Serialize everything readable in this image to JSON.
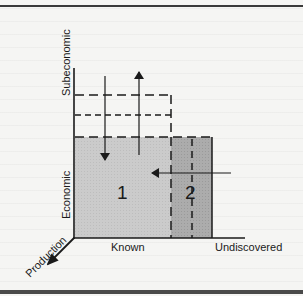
{
  "diagram": {
    "axes": {
      "vertical_upper_label": "Subeconomic",
      "vertical_lower_label": "Economic",
      "horizontal_left_label": "Known",
      "horizontal_right_label": "Undiscovered",
      "depth_label": "Production"
    },
    "regions": [
      {
        "id": "1",
        "label": "1",
        "description": "Known economic resources",
        "fill": "#c8c8c8"
      },
      {
        "id": "2",
        "label": "2",
        "description": "Undiscovered economic resources",
        "fill": "#a9a9a9"
      }
    ],
    "arrows": [
      {
        "id": "down",
        "direction": "down",
        "meaning": "economic boundary shifts down"
      },
      {
        "id": "up",
        "direction": "up",
        "meaning": "economic boundary shifts up"
      },
      {
        "id": "left",
        "direction": "left",
        "meaning": "undiscovered becomes known"
      },
      {
        "id": "production",
        "direction": "down-left",
        "meaning": "production axis"
      }
    ],
    "colors": {
      "ink": "#1a1a1a",
      "region1": "#c8c8c8",
      "region2": "#a9a9a9",
      "paper": "#f5f5f3"
    }
  }
}
